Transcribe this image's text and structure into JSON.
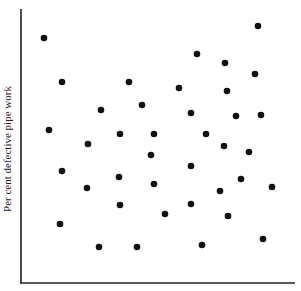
{
  "chart_data": {
    "type": "scatter",
    "title": "",
    "xlabel": "",
    "ylabel": "Per cent defective pipe work",
    "grid": false,
    "legend": null,
    "ticks": "none (axes have no tick marks or tick labels)",
    "units_note": "Values are normalized 0-100 positions within the plot frame (no numeric scale shown)",
    "xlim": [
      0,
      100
    ],
    "ylim": [
      0,
      100
    ],
    "marker_color": "#111111",
    "axis_color": "#222222",
    "points": [
      {
        "x": 8.4,
        "y": 89.4
      },
      {
        "x": 14.96,
        "y": 73.36
      },
      {
        "x": 29.2,
        "y": 63.14
      },
      {
        "x": 39.42,
        "y": 73.36
      },
      {
        "x": 44.16,
        "y": 64.96
      },
      {
        "x": 57.66,
        "y": 71.17
      },
      {
        "x": 64.23,
        "y": 83.58
      },
      {
        "x": 62.04,
        "y": 62.04
      },
      {
        "x": 86.5,
        "y": 93.8
      },
      {
        "x": 74.45,
        "y": 80.29
      },
      {
        "x": 85.4,
        "y": 76.28
      },
      {
        "x": 75.18,
        "y": 70.07
      },
      {
        "x": 78.47,
        "y": 60.95
      },
      {
        "x": 87.59,
        "y": 61.31
      },
      {
        "x": 10.22,
        "y": 55.84
      },
      {
        "x": 24.45,
        "y": 50.73
      },
      {
        "x": 36.13,
        "y": 54.38
      },
      {
        "x": 48.54,
        "y": 54.38
      },
      {
        "x": 67.52,
        "y": 54.38
      },
      {
        "x": 47.45,
        "y": 46.72
      },
      {
        "x": 62.04,
        "y": 42.7
      },
      {
        "x": 74.09,
        "y": 50.0
      },
      {
        "x": 83.21,
        "y": 47.81
      },
      {
        "x": 14.96,
        "y": 40.88
      },
      {
        "x": 24.09,
        "y": 34.67
      },
      {
        "x": 35.77,
        "y": 38.69
      },
      {
        "x": 48.54,
        "y": 36.13
      },
      {
        "x": 80.29,
        "y": 37.96
      },
      {
        "x": 72.63,
        "y": 33.58
      },
      {
        "x": 91.61,
        "y": 35.04
      },
      {
        "x": 36.13,
        "y": 28.47
      },
      {
        "x": 14.23,
        "y": 21.53
      },
      {
        "x": 28.47,
        "y": 13.14
      },
      {
        "x": 42.34,
        "y": 13.14
      },
      {
        "x": 62.04,
        "y": 28.83
      },
      {
        "x": 52.55,
        "y": 25.18
      },
      {
        "x": 75.55,
        "y": 24.45
      },
      {
        "x": 66.06,
        "y": 13.87
      },
      {
        "x": 88.32,
        "y": 16.06
      }
    ]
  }
}
